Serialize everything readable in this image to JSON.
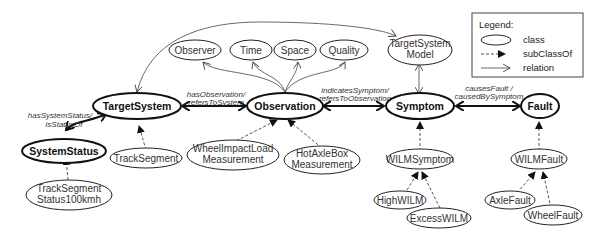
{
  "nodes": {
    "target_system": "TargetSystem",
    "system_status": "SystemStatus",
    "track_segment": "TrackSegment",
    "track_segment_status_l1": "TrackSegment",
    "track_segment_status_l2": "Status100kmh",
    "observation": "Observation",
    "observer": "Observer",
    "time": "Time",
    "space": "Space",
    "quality": "Quality",
    "wilm_meas_l1": "WheelImpactLoad",
    "wilm_meas_l2": "Measurement",
    "hab_meas_l1": "HotAxleBox",
    "hab_meas_l2": "Measurement",
    "target_system_model_l1": "TargetSystem",
    "target_system_model_l2": "Model",
    "symptom": "Symptom",
    "wilm_symptom": "WILMSymptom",
    "high_wilm": "HighWILM",
    "excess_wilm": "ExcessWILM",
    "fault": "Fault",
    "wilm_fault": "WILMFault",
    "axle_fault": "AxleFault",
    "wheel_fault": "WheelFault"
  },
  "relations": {
    "system_status_l1": "hasSystemStatus/",
    "system_status_l2": "isStatusOf",
    "observation_l1": "hasObservation/",
    "observation_l2": "refersToSystem",
    "symptom_l1": "indicatesSymptom/",
    "symptom_l2": "refersToObservation",
    "fault_l1": "causesFault /",
    "fault_l2": "causedBySymptom"
  },
  "legend": {
    "title": "Legend:",
    "class": "class",
    "subclass": "subClassOf",
    "relation": "relation"
  }
}
